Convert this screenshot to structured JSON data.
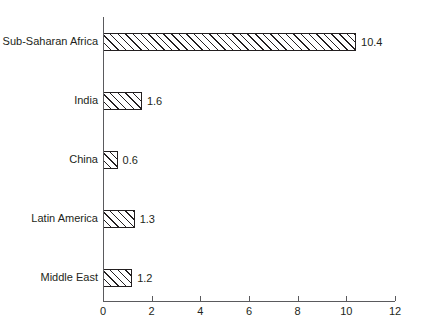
{
  "chart_data": {
    "type": "bar",
    "orientation": "horizontal",
    "title": "",
    "subtitle": "",
    "xlabel": "",
    "ylabel": "",
    "xlim": [
      0,
      12
    ],
    "xticks": [
      0,
      2,
      4,
      6,
      8,
      10,
      12
    ],
    "grid": false,
    "legend": false,
    "categories": [
      "Sub-Saharan Africa",
      "India",
      "China",
      "Latin America",
      "Middle East"
    ],
    "values": [
      10.4,
      1.6,
      0.6,
      1.3,
      1.2
    ],
    "data_labels": [
      "10.4",
      "1.6",
      "0.6",
      "1.3",
      "1.2"
    ],
    "bar_style": {
      "fill": "#ffffff",
      "edge": "#231f20",
      "hatch": "diagonal-forward"
    },
    "axis_color": "#5a5a5d",
    "text_color": "#231f20"
  },
  "ticks": {
    "labels": [
      "0",
      "2",
      "4",
      "6",
      "8",
      "10",
      "12"
    ]
  }
}
